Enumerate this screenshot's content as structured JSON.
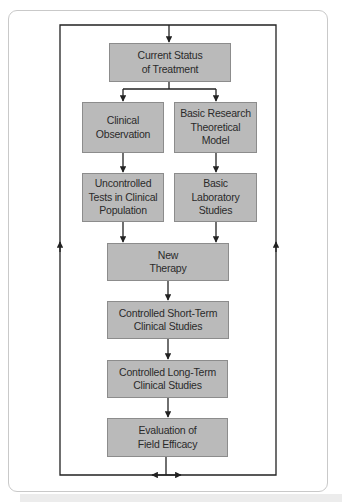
{
  "diagram": {
    "type": "flowchart",
    "colors": {
      "box_fill": "#bababa",
      "box_border": "#8c8c8c",
      "line": "#222222",
      "card_border": "#c9c9c9"
    },
    "nodes": {
      "current_status": "Current Status\nof Treatment",
      "clinical_observation": "Clinical\nObservation",
      "basic_research": "Basic Research\nTheoretical\nModel",
      "uncontrolled_tests": "Uncontrolled\nTests in Clinical\nPopulation",
      "basic_lab": "Basic\nLaboratory\nStudies",
      "new_therapy": "New\nTherapy",
      "short_term": "Controlled Short-Term\nClinical Studies",
      "long_term": "Controlled Long-Term\nClinical Studies",
      "evaluation": "Evaluation of\nField Efficacy"
    },
    "edges": [
      [
        "current_status",
        "clinical_observation"
      ],
      [
        "current_status",
        "basic_research"
      ],
      [
        "clinical_observation",
        "uncontrolled_tests"
      ],
      [
        "basic_research",
        "basic_lab"
      ],
      [
        "uncontrolled_tests",
        "new_therapy"
      ],
      [
        "basic_lab",
        "new_therapy"
      ],
      [
        "new_therapy",
        "short_term"
      ],
      [
        "short_term",
        "long_term"
      ],
      [
        "long_term",
        "evaluation"
      ],
      [
        "evaluation",
        "current_status",
        "feedback loop via left and right sides"
      ]
    ]
  }
}
